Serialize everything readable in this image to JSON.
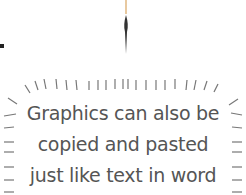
{
  "caption": {
    "lines": [
      "Graphics can also be",
      "copied and pasted",
      "just like text in word"
    ]
  },
  "graphic": {
    "icon": "pen-icon",
    "frame": "radiating-dash-burst"
  },
  "colors": {
    "text": "#555555",
    "strokes": "#666666",
    "pen_tip": "#e8c9a0"
  }
}
